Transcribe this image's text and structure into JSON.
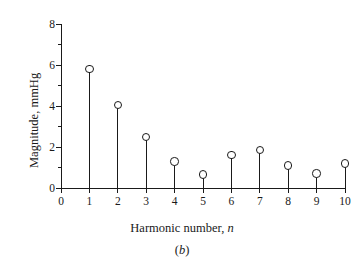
{
  "chart_data": {
    "type": "scatter",
    "style": "stem",
    "title": "",
    "subtitle": "",
    "caption": "(b)",
    "caption_italic_part": "b",
    "xlabel_text": "Harmonic number, ",
    "xlabel_italic": "n",
    "ylabel": "Magnitude, mmHg",
    "x": [
      1,
      2,
      3,
      4,
      5,
      6,
      7,
      8,
      9,
      10
    ],
    "values": [
      5.8,
      4.05,
      2.5,
      1.3,
      0.65,
      1.6,
      1.85,
      1.1,
      0.7,
      1.2
    ],
    "categories": [
      "1",
      "2",
      "3",
      "4",
      "5",
      "6",
      "7",
      "8",
      "9",
      "10"
    ],
    "xlim": [
      0,
      10
    ],
    "ylim": [
      0,
      8
    ],
    "xticks": [
      0,
      1,
      2,
      3,
      4,
      5,
      6,
      7,
      8,
      9,
      10
    ],
    "xticklabels": [
      "0",
      "1",
      "2",
      "3",
      "4",
      "5",
      "6",
      "7",
      "8",
      "9",
      "10"
    ],
    "yticks_major": [
      0,
      2,
      4,
      6,
      8
    ],
    "yticklabels": [
      "0",
      "2",
      "4",
      "6",
      "8"
    ],
    "yticks_minor": [
      1,
      3,
      5,
      7
    ],
    "grid": false,
    "legend": null,
    "marker": "open-circle",
    "color": "#1a1a1a"
  }
}
